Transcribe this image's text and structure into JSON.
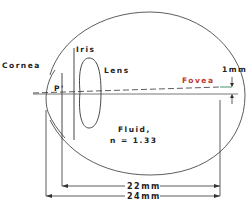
{
  "diagram": {
    "type": "eye-cross-section",
    "labels": {
      "cornea": "Cornea",
      "iris": "Iris",
      "lens": "Lens",
      "pupil_point": "P'",
      "fovea": "Fovea",
      "fovea_offset": "1mm",
      "fluid_line1": "Fluid,",
      "fluid_line2": "n = 1.33",
      "dim_inner": "22mm",
      "dim_outer": "24mm"
    },
    "colors": {
      "line": "#333333",
      "fovea_text": "#c0392b",
      "fovea_marker": "#2e8b57",
      "background": "#ffffff"
    }
  }
}
